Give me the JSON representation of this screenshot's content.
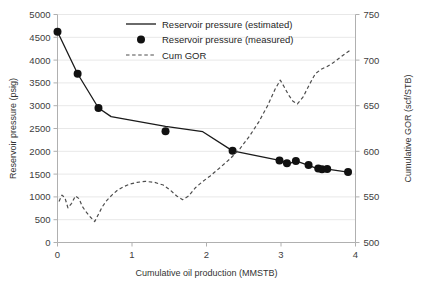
{
  "chart_data": {
    "type": "line",
    "title": "",
    "xlabel": "Cumulative oil production (MMSTB)",
    "ylabel": "Reservoir pressure (psig)",
    "y2label": "Cumulative GOR (scf/STB)",
    "xlim": [
      0,
      4
    ],
    "ylim": [
      0,
      5000
    ],
    "y2lim": [
      500,
      750
    ],
    "xticks": [
      "0",
      "1",
      "2",
      "3",
      "4"
    ],
    "xtick_values": [
      0,
      1,
      2,
      3,
      4
    ],
    "yticks": [
      "0",
      "500",
      "1000",
      "1500",
      "2000",
      "2500",
      "3000",
      "3500",
      "4000",
      "4500",
      "5000"
    ],
    "ytick_values": [
      0,
      500,
      1000,
      1500,
      2000,
      2500,
      3000,
      3500,
      4000,
      4500,
      5000
    ],
    "y2ticks": [
      "500",
      "550",
      "600",
      "650",
      "700",
      "750"
    ],
    "y2tick_values": [
      500,
      550,
      600,
      650,
      700,
      750
    ],
    "grid": "horizontal",
    "legend_position": "top-center",
    "series": [
      {
        "name": "Reservoir pressure (estimated)",
        "axis": "left",
        "style": "solid-line",
        "color": "#1a1a1a",
        "points": [
          [
            0.0,
            4620
          ],
          [
            0.27,
            3700
          ],
          [
            0.55,
            2950
          ],
          [
            0.72,
            2760
          ],
          [
            1.0,
            2680
          ],
          [
            1.45,
            2545
          ],
          [
            1.95,
            2430
          ],
          [
            2.35,
            2010
          ],
          [
            2.98,
            1800
          ],
          [
            3.12,
            1735
          ],
          [
            3.2,
            1790
          ],
          [
            3.35,
            1700
          ],
          [
            3.48,
            1625
          ],
          [
            3.55,
            1600
          ],
          [
            3.62,
            1610
          ],
          [
            3.9,
            1545
          ]
        ]
      },
      {
        "name": "Reservoir pressure (measured)",
        "axis": "left",
        "style": "markers",
        "color": "#111111",
        "points": [
          [
            0.0,
            4620
          ],
          [
            0.27,
            3700
          ],
          [
            0.55,
            2950
          ],
          [
            1.45,
            2440
          ],
          [
            2.35,
            2010
          ],
          [
            2.98,
            1800
          ],
          [
            3.08,
            1740
          ],
          [
            3.2,
            1790
          ],
          [
            3.37,
            1700
          ],
          [
            3.5,
            1625
          ],
          [
            3.55,
            1605
          ],
          [
            3.62,
            1610
          ],
          [
            3.9,
            1545
          ]
        ]
      },
      {
        "name": "Cum GOR",
        "axis": "right",
        "style": "dashed-line",
        "color": "#4d4d4d",
        "points": [
          [
            0.02,
            545
          ],
          [
            0.06,
            552
          ],
          [
            0.1,
            549
          ],
          [
            0.14,
            538
          ],
          [
            0.19,
            543
          ],
          [
            0.24,
            551
          ],
          [
            0.29,
            548
          ],
          [
            0.33,
            540
          ],
          [
            0.38,
            534
          ],
          [
            0.44,
            528
          ],
          [
            0.5,
            523
          ],
          [
            0.55,
            531
          ],
          [
            0.6,
            539
          ],
          [
            0.66,
            546
          ],
          [
            0.73,
            552
          ],
          [
            0.8,
            557
          ],
          [
            0.88,
            561
          ],
          [
            0.97,
            564
          ],
          [
            1.07,
            566
          ],
          [
            1.18,
            567
          ],
          [
            1.3,
            566
          ],
          [
            1.42,
            563
          ],
          [
            1.52,
            557
          ],
          [
            1.6,
            551
          ],
          [
            1.68,
            547
          ],
          [
            1.76,
            551
          ],
          [
            1.85,
            560
          ],
          [
            1.95,
            567
          ],
          [
            2.05,
            573
          ],
          [
            2.18,
            582
          ],
          [
            2.32,
            592
          ],
          [
            2.45,
            603
          ],
          [
            2.58,
            617
          ],
          [
            2.7,
            632
          ],
          [
            2.82,
            650
          ],
          [
            2.92,
            668
          ],
          [
            2.99,
            678
          ],
          [
            3.04,
            671
          ],
          [
            3.1,
            662
          ],
          [
            3.16,
            655
          ],
          [
            3.22,
            652
          ],
          [
            3.3,
            660
          ],
          [
            3.38,
            673
          ],
          [
            3.46,
            685
          ],
          [
            3.54,
            690
          ],
          [
            3.62,
            693
          ],
          [
            3.7,
            697
          ],
          [
            3.78,
            702
          ],
          [
            3.86,
            707
          ],
          [
            3.93,
            711
          ]
        ]
      }
    ],
    "legend": [
      {
        "label": "Reservoir pressure (estimated)",
        "marker": "line"
      },
      {
        "label": "Reservoir pressure (measured)",
        "marker": "dot"
      },
      {
        "label": "Cum GOR",
        "marker": "dashed"
      }
    ]
  }
}
